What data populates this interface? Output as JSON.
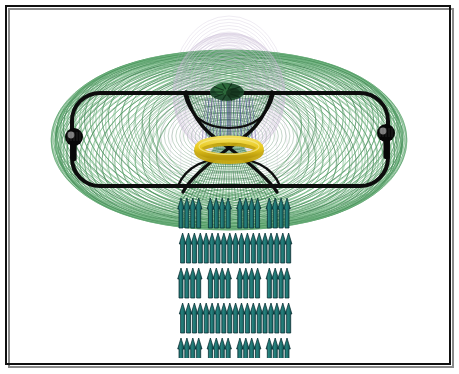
{
  "figure": {
    "title": "",
    "domain": "scientific-illustration",
    "canvas": {
      "width": 459,
      "height": 374,
      "background": "#ffffff"
    },
    "border": {
      "name": "figure-border",
      "color": "#111111",
      "width_px": 2,
      "inset_px": 6,
      "shadow_color": "#7a7a7a"
    }
  },
  "palette": {
    "green_field": "#3f8f52",
    "green_field_light": "#6fb57f",
    "dark_green": "#1d4a2c",
    "lavender": "#b9a8c8",
    "lavender_light": "#d6cbe0",
    "black_loop": "#0d0d0d",
    "yellow_ring": "#e8c81e",
    "yellow_ring_shade": "#c6a60f",
    "teal_arrow": "#1f7a78",
    "teal_arrow_dark": "#0f4f50",
    "teal_arrow_edge": "#0a2f33",
    "blue_streak": "#3b3f8f",
    "white": "#ffffff"
  },
  "elements": {
    "green_torus": {
      "name": "green-toroidal-field-lines",
      "label": "Green toroidal field line family",
      "count": 44,
      "center": {
        "x": 229,
        "y": 140
      },
      "rx_min": 34,
      "rx_max": 174,
      "ry_min": 22,
      "ry_max": 88,
      "rotation_span_deg": 180,
      "stroke_width": 0.8,
      "opacity": 0.85
    },
    "lavender_dome": {
      "name": "lavender-dome-field-lines",
      "label": "Upper lavender dome arcs",
      "count": 26,
      "center": {
        "x": 229,
        "y": 95
      },
      "rx_min": 12,
      "rx_max": 56,
      "ry_min": 18,
      "ry_max": 62,
      "stroke_width": 0.7,
      "opacity": 0.65
    },
    "black_loop": {
      "name": "black-circuit-loop",
      "label": "Black stadium circuit loop",
      "left_x": 72,
      "right_x": 388,
      "top_y": 93,
      "bottom_y": 186,
      "corner_radius": 28,
      "stroke_width": 4
    },
    "nodes": [
      {
        "name": "left-coil-node",
        "cx": 74,
        "cy": 137,
        "r": 9,
        "stem_h": 24
      },
      {
        "name": "right-coil-node",
        "cx": 386,
        "cy": 133,
        "r": 9,
        "stem_h": 26
      }
    ],
    "bowtie": {
      "name": "central-hourglass-structure",
      "label": "Central converging-diverging hourglass",
      "top_left": {
        "x": 186,
        "y": 92
      },
      "top_right": {
        "x": 272,
        "y": 92
      },
      "waist": {
        "x": 229,
        "y": 148
      },
      "bottom_left": {
        "x": 183,
        "y": 192
      },
      "bottom_right": {
        "x": 277,
        "y": 192
      },
      "stroke_width": 3.4
    },
    "yellow_ring": {
      "name": "yellow-waist-ring",
      "label": "Yellow annular ring at the throat",
      "cx": 229,
      "cy": 148,
      "rx": 31,
      "ry": 9,
      "thickness": 7
    },
    "dark_cluster": {
      "name": "central-dark-cluster",
      "label": "Dark green knot at top of hourglass",
      "cx": 227,
      "cy": 92,
      "rx": 17,
      "ry": 9
    },
    "arrow_field": {
      "name": "teal-exhaust-arrow-grid",
      "label": "Teal exhaust arrow array",
      "rows": 5,
      "cols": 19,
      "x_start": 181,
      "x_end": 287,
      "y_start": 198,
      "row_pitch": 35,
      "arrow_width": 6.6,
      "arrow_height": 30,
      "direction": "up",
      "gap_columns": [
        4,
        9,
        14
      ]
    }
  }
}
